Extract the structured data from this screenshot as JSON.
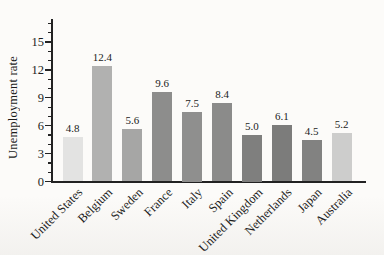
{
  "page": {
    "background": "#fcfbf9",
    "axis_color": "#222222",
    "text_color": "#1b1b1b"
  },
  "chart_data": {
    "type": "bar",
    "title": "",
    "xlabel": "",
    "ylabel": "Unemployment rate",
    "categories": [
      "United States",
      "Belgium",
      "Sweden",
      "France",
      "Italy",
      "Spain",
      "United Kingdom",
      "Netherlands",
      "Japan",
      "Australia"
    ],
    "values": [
      4.8,
      12.4,
      5.6,
      9.6,
      7.5,
      8.4,
      5.0,
      6.1,
      4.5,
      5.2
    ],
    "value_labels": [
      "4.8",
      "12.4",
      "5.6",
      "9.6",
      "7.5",
      "8.4",
      "5.0",
      "6.1",
      "4.5",
      "5.2"
    ],
    "bar_colors": [
      "#e3e3e2",
      "#b1b1b0",
      "#a6a6a5",
      "#8d8d8c",
      "#8f8f8e",
      "#8b8b8a",
      "#7f7f7e",
      "#7c7c7b",
      "#828281",
      "#cdcdcc"
    ],
    "yticks": [
      0,
      3,
      6,
      9,
      12,
      15
    ],
    "minor_tick_step": 1,
    "ylim": [
      0,
      17.5
    ],
    "grid": false,
    "legend": null
  }
}
